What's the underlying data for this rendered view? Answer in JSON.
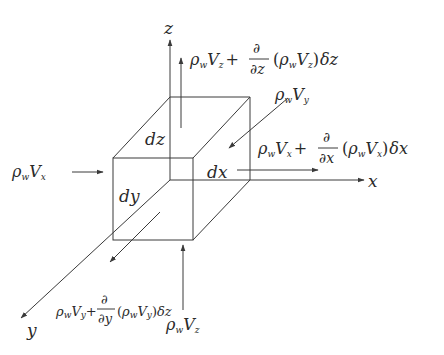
{
  "diagram": {
    "axes": {
      "x": "x",
      "y": "y",
      "z": "z"
    },
    "edges": {
      "dx": "dx",
      "dy": "dy",
      "dz": "dz"
    },
    "fluxes": {
      "x_in": {
        "rho": "ρ",
        "w": "w",
        "V": "V",
        "comp": "x"
      },
      "x_out": {
        "rho": "ρ",
        "w": "w",
        "V": "V",
        "comp": "x",
        "plus": "+",
        "partial": "∂",
        "denom": "∂x",
        "paren_open": "(",
        "paren_close": ")",
        "delta": "δx"
      },
      "y_in": {
        "rho": "ρ",
        "w": "w",
        "V": "V",
        "comp": "y"
      },
      "y_out": {
        "rho": "ρ",
        "w": "w",
        "V": "V",
        "comp": "y",
        "plus": "+",
        "partial": "∂",
        "denom": "∂y",
        "paren_open": "(",
        "paren_close": ")",
        "delta": "δz"
      },
      "z_in": {
        "rho": "ρ",
        "w": "w",
        "V": "V",
        "comp": "z"
      },
      "z_out": {
        "rho": "ρ",
        "w": "w",
        "V": "V",
        "comp": "z",
        "plus": "+",
        "partial": "∂",
        "denom": "∂z",
        "paren_open": "(",
        "paren_close": ")",
        "delta": "δz"
      }
    },
    "colors": {
      "line": "#3a3a3a",
      "text": "#2a2a2a",
      "background": "#ffffff"
    }
  }
}
